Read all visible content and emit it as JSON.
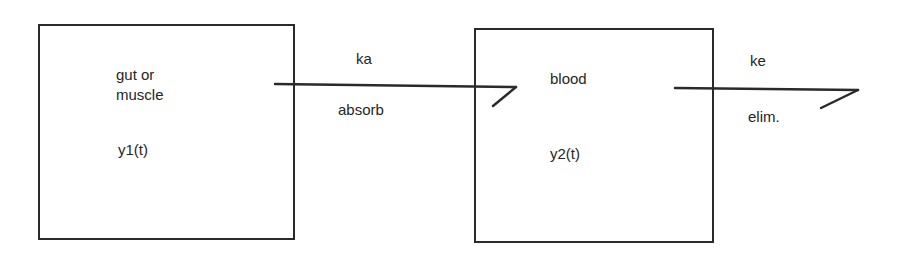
{
  "diagram": {
    "type": "two-compartment pharmacokinetic model",
    "compartments": [
      {
        "id": "c1",
        "label_line1": "gut or",
        "label_line2": "muscle",
        "variable": "y1(t)"
      },
      {
        "id": "c2",
        "label": "blood",
        "variable": "y2(t)"
      }
    ],
    "flows": [
      {
        "from": "c1",
        "to": "c2",
        "rate": "ka",
        "description": "absorb"
      },
      {
        "from": "c2",
        "to": "out",
        "rate": "ke",
        "description": "elim."
      }
    ],
    "colors": {
      "line": "#2a2a2a",
      "background": "#ffffff"
    }
  }
}
